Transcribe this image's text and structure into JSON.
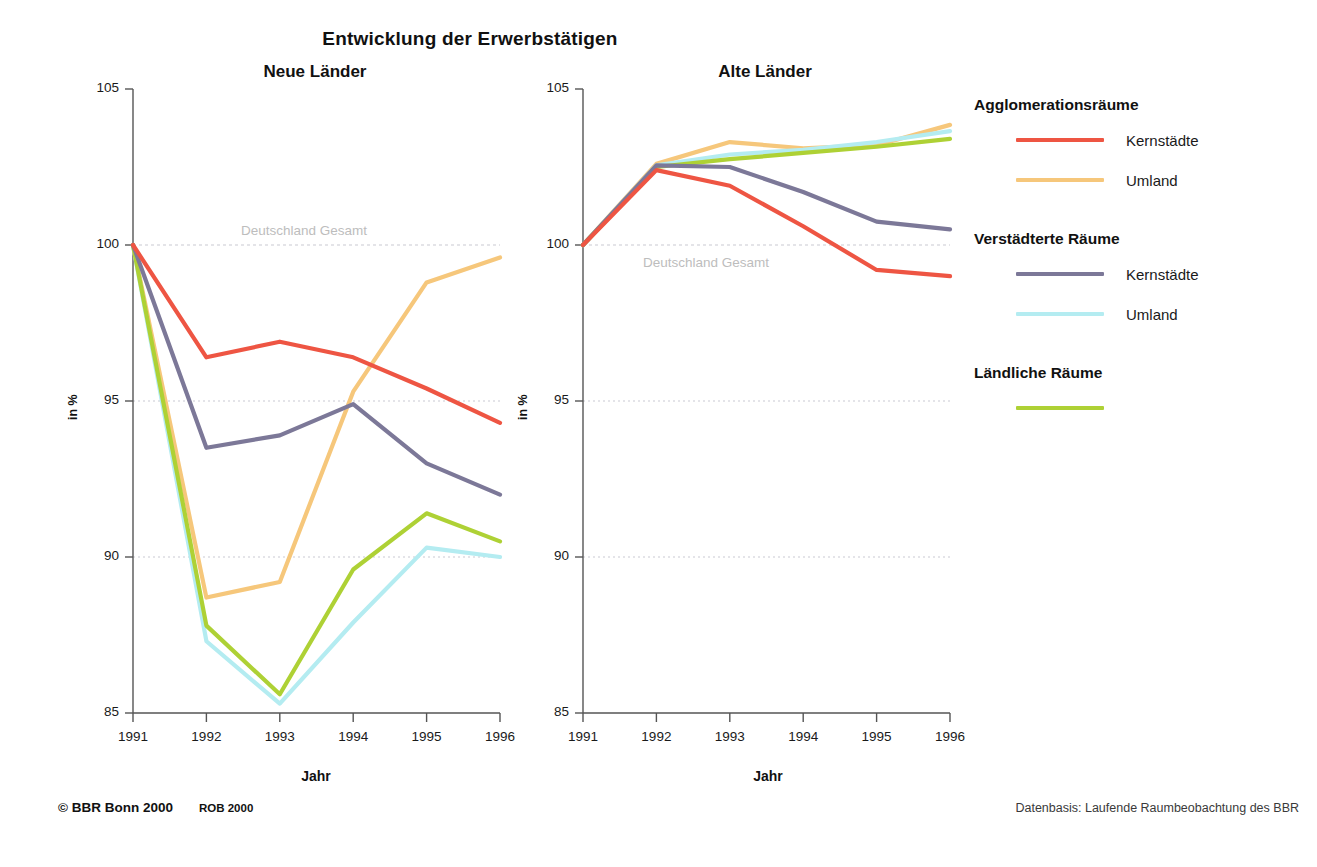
{
  "header": {
    "main_title": "Entwicklung der Erwerbstätigen"
  },
  "panels": [
    {
      "id": "neue-laender",
      "title": "Neue Länder",
      "xlabel": "Jahr",
      "ylabel": "in %",
      "reference_label": "Deutschland Gesamt"
    },
    {
      "id": "alte-laender",
      "title": "Alte Länder",
      "xlabel": "Jahr",
      "ylabel": "in %",
      "reference_label": "Deutschland Gesamt"
    }
  ],
  "axis": {
    "y_ticks": [
      "105",
      "100",
      "95",
      "90",
      "85"
    ],
    "x_ticks": [
      "1991",
      "1992",
      "1993",
      "1994",
      "1995",
      "1996"
    ]
  },
  "legend": {
    "groups": [
      {
        "heading": "Agglomerationsräume",
        "items": [
          {
            "label": "Kernstädte",
            "color": "#ee5543"
          },
          {
            "label": "Umland",
            "color": "#f6c77b"
          }
        ]
      },
      {
        "heading": "Verstädterte Räume",
        "items": [
          {
            "label": "Kernstädte",
            "color": "#7c7898"
          },
          {
            "label": "Umland",
            "color": "#b4ecf1"
          }
        ]
      },
      {
        "heading": "Ländliche Räume",
        "items": [
          {
            "label": "",
            "color": "#aed135"
          }
        ]
      }
    ]
  },
  "footer": {
    "copyright": "© BBR Bonn 2000",
    "rob": "ROB 2000",
    "source": "Datenbasis: Laufende Raumbeobachtung des BBR"
  },
  "colors": {
    "agglo_kernstaedte": "#ee5543",
    "agglo_umland": "#f6c77b",
    "verstaedtert_kernstaedte": "#7c7898",
    "verstaedtert_umland": "#b4ecf1",
    "laendlich": "#aed135",
    "gridline": "#c9c9d2",
    "axis": "#555555",
    "reference_text": "#bdbdbd"
  },
  "chart_data": [
    {
      "type": "line",
      "title": "Neue Länder",
      "subtitle": "Entwicklung der Erwerbstätigen",
      "xlabel": "Jahr",
      "ylabel": "in %",
      "x": [
        1991,
        1992,
        1993,
        1994,
        1995,
        1996
      ],
      "categories": [
        "1991",
        "1992",
        "1993",
        "1994",
        "1995",
        "1996"
      ],
      "ylim": [
        85,
        105
      ],
      "xlim": [
        1991,
        1996
      ],
      "yticks": [
        85,
        90,
        95,
        100,
        105
      ],
      "grid": "horizontal-dotted at 90, 95, 100",
      "legend_position": "right",
      "annotations": [
        {
          "text": "Deutschland Gesamt",
          "y": 100,
          "note": "reference line at index 100"
        }
      ],
      "series": [
        {
          "name": "Agglomerationsräume – Kernstädte",
          "color": "#ee5543",
          "values": [
            100.0,
            96.4,
            96.9,
            96.4,
            95.4,
            94.3
          ]
        },
        {
          "name": "Agglomerationsräume – Umland",
          "color": "#f6c77b",
          "values": [
            100.0,
            88.7,
            89.2,
            95.3,
            98.8,
            99.6
          ]
        },
        {
          "name": "Verstädterte Räume – Kernstädte",
          "color": "#7c7898",
          "values": [
            100.0,
            93.5,
            93.9,
            94.9,
            93.0,
            92.0
          ]
        },
        {
          "name": "Verstädterte Räume – Umland",
          "color": "#b4ecf1",
          "values": [
            100.0,
            87.3,
            85.3,
            87.9,
            90.3,
            90.0
          ]
        },
        {
          "name": "Ländliche Räume",
          "color": "#aed135",
          "values": [
            100.0,
            87.8,
            85.6,
            89.6,
            91.4,
            90.5
          ]
        }
      ]
    },
    {
      "type": "line",
      "title": "Alte Länder",
      "subtitle": "Entwicklung der Erwerbstätigen",
      "xlabel": "Jahr",
      "ylabel": "in %",
      "x": [
        1991,
        1992,
        1993,
        1994,
        1995,
        1996
      ],
      "categories": [
        "1991",
        "1992",
        "1993",
        "1994",
        "1995",
        "1996"
      ],
      "ylim": [
        85,
        105
      ],
      "xlim": [
        1991,
        1996
      ],
      "yticks": [
        85,
        90,
        95,
        100,
        105
      ],
      "grid": "horizontal-dotted at 90, 95, 100",
      "legend_position": "right",
      "annotations": [
        {
          "text": "Deutschland Gesamt",
          "y": 100,
          "note": "reference line at index 100"
        }
      ],
      "series": [
        {
          "name": "Agglomerationsräume – Kernstädte",
          "color": "#ee5543",
          "values": [
            100.0,
            102.4,
            101.9,
            100.6,
            99.2,
            99.0
          ]
        },
        {
          "name": "Agglomerationsräume – Umland",
          "color": "#f6c77b",
          "values": [
            100.0,
            102.6,
            103.3,
            103.1,
            103.2,
            103.85
          ]
        },
        {
          "name": "Verstädterte Räume – Kernstädte",
          "color": "#7c7898",
          "values": [
            100.0,
            102.55,
            102.5,
            101.7,
            100.75,
            100.5
          ]
        },
        {
          "name": "Verstädterte Räume – Umland",
          "color": "#b4ecf1",
          "values": [
            100.0,
            102.55,
            102.9,
            103.05,
            103.3,
            103.65
          ]
        },
        {
          "name": "Ländliche Räume",
          "color": "#aed135",
          "values": [
            100.0,
            102.5,
            102.75,
            102.95,
            103.15,
            103.4
          ]
        }
      ]
    }
  ]
}
